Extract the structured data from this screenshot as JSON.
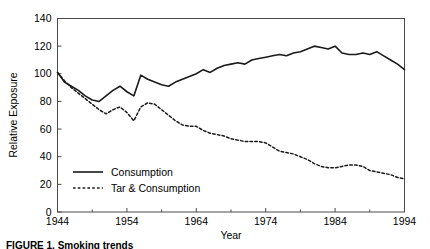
{
  "chart_data": {
    "type": "line",
    "title": "",
    "xlabel": "Year",
    "ylabel": "Relative Exposure",
    "xlim": [
      1944,
      1994
    ],
    "ylim": [
      0,
      140
    ],
    "ytick_step": 20,
    "xtick_step": 10,
    "xminor_step": 5,
    "grid": false,
    "legend_position": "inside-lower-left",
    "xticks": [
      "1944",
      "1954",
      "1964",
      "1974",
      "1984",
      "1994"
    ],
    "yticks": [
      "0",
      "20",
      "40",
      "60",
      "80",
      "100",
      "120",
      "140"
    ],
    "x": [
      1944,
      1945,
      1946,
      1947,
      1948,
      1949,
      1950,
      1951,
      1952,
      1953,
      1954,
      1955,
      1956,
      1957,
      1958,
      1959,
      1960,
      1961,
      1962,
      1963,
      1964,
      1965,
      1966,
      1967,
      1968,
      1969,
      1970,
      1971,
      1972,
      1973,
      1974,
      1975,
      1976,
      1977,
      1978,
      1979,
      1980,
      1981,
      1982,
      1983,
      1984,
      1985,
      1986,
      1987,
      1988,
      1989,
      1990,
      1991,
      1992,
      1993,
      1994
    ],
    "series": [
      {
        "name": "Consumption",
        "style": "solid",
        "color": "#1a1a1a",
        "values": [
          101,
          94,
          91,
          88,
          84,
          81,
          80,
          84,
          88,
          91,
          87,
          84,
          99,
          96,
          94,
          92,
          91,
          94,
          96,
          98,
          100,
          103,
          101,
          104,
          106,
          107,
          108,
          107,
          110,
          111,
          112,
          113,
          114,
          113,
          115,
          116,
          118,
          120,
          119,
          118,
          120,
          115,
          114,
          114,
          115,
          114,
          116,
          113,
          110,
          107,
          103
        ]
      },
      {
        "name": "Tar & Consumption",
        "style": "dashed",
        "color": "#1a1a1a",
        "values": [
          101,
          95,
          90,
          86,
          82,
          78,
          74,
          71,
          74,
          76,
          72,
          66,
          76,
          79,
          78,
          74,
          70,
          66,
          63,
          62,
          62,
          59,
          57,
          56,
          55,
          53,
          52,
          51,
          51,
          51,
          50,
          47,
          44,
          43,
          42,
          40,
          38,
          35,
          33,
          32,
          32,
          33,
          34,
          34,
          33,
          30,
          29,
          28,
          27,
          25,
          24
        ]
      }
    ]
  },
  "legend": {
    "items": [
      {
        "label": "Consumption",
        "style": "solid"
      },
      {
        "label": "Tar & Consumption",
        "style": "dashed"
      }
    ]
  },
  "caption": {
    "text": "FIGURE 1.  Smoking trends"
  }
}
